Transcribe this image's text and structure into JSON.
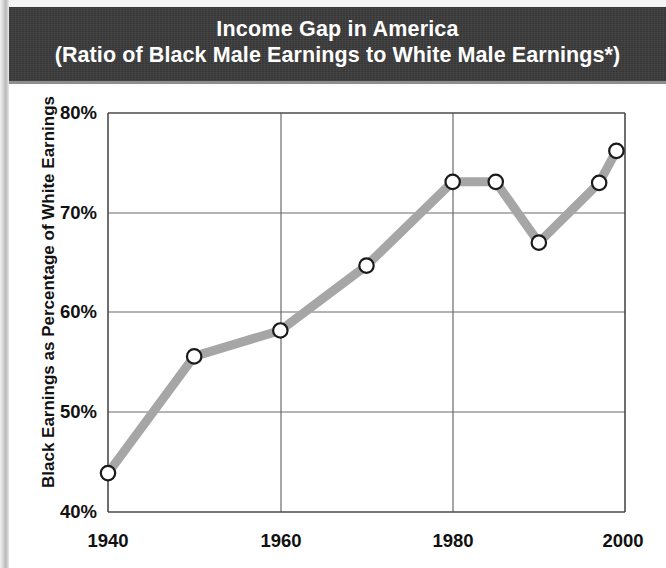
{
  "header": {
    "title_line1": "Income Gap in America",
    "title_line2": "(Ratio of Black Male Earnings to White Male Earnings*)"
  },
  "axes": {
    "y_title": "Black Earnings as Percentage of White Earnings",
    "y_ticks": [
      "80%",
      "70%",
      "60%",
      "50%",
      "40%"
    ],
    "x_ticks": [
      "1940",
      "1960",
      "1980",
      "2000"
    ]
  },
  "colors": {
    "banner_background": "#3b3b3b",
    "banner_text": "#ffffff",
    "line": "#a6a6a6",
    "marker_stroke": "#1a1a1a",
    "marker_fill": "#ffffff",
    "grid": "#5a5a5a",
    "axis": "#3c3c3c",
    "plot_background": "#ffffff"
  },
  "chart_data": {
    "type": "line",
    "title": "Income Gap in America (Ratio of Black Male Earnings to White Male Earnings*)",
    "xlabel": "",
    "ylabel": "Black Earnings as Percentage of White Earnings",
    "xlim": [
      1940,
      2000
    ],
    "ylim": [
      40,
      80
    ],
    "xticks": [
      1940,
      1960,
      1980,
      2000
    ],
    "yticks": [
      40,
      50,
      60,
      70,
      80
    ],
    "grid": true,
    "legend": "none",
    "x": [
      1940,
      1950,
      1960,
      1970,
      1980,
      1985,
      1990,
      1997,
      1999
    ],
    "values": [
      43.9,
      55.6,
      58.2,
      64.7,
      73.1,
      73.1,
      67.0,
      73.0,
      76.2
    ],
    "series": [
      {
        "name": "Black male earnings as % of white male earnings",
        "x": [
          1940,
          1950,
          1960,
          1970,
          1980,
          1985,
          1990,
          1997,
          1999
        ],
        "values": [
          43.9,
          55.6,
          58.2,
          64.7,
          73.1,
          73.1,
          67.0,
          73.0,
          76.2
        ]
      }
    ],
    "markers": "open-circle",
    "units": "percent"
  }
}
